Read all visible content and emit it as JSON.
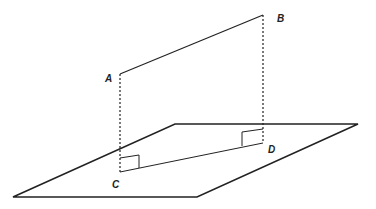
{
  "diagram": {
    "type": "3D geometry: segment AB projected perpendicularly onto plane as CD",
    "points": {
      "A": {
        "label": "A",
        "x": 120,
        "y": 74
      },
      "B": {
        "label": "B",
        "x": 263,
        "y": 15
      },
      "C": {
        "label": "C",
        "x": 120,
        "y": 172
      },
      "D": {
        "label": "D",
        "x": 263,
        "y": 143
      }
    },
    "plane": {
      "vertices": [
        [
          13,
          197
        ],
        [
          175,
          124
        ],
        [
          358,
          124
        ],
        [
          197,
          197
        ]
      ]
    },
    "segments": [
      {
        "from": "A",
        "to": "B",
        "style": "solid"
      },
      {
        "from": "C",
        "to": "D",
        "style": "solid"
      },
      {
        "from": "A",
        "to": "C",
        "style": "dashed"
      },
      {
        "from": "B",
        "to": "D",
        "style": "dashed"
      }
    ],
    "right_angles": [
      "C",
      "D"
    ],
    "colors": {
      "stroke": "#222222",
      "background": "#ffffff"
    }
  }
}
